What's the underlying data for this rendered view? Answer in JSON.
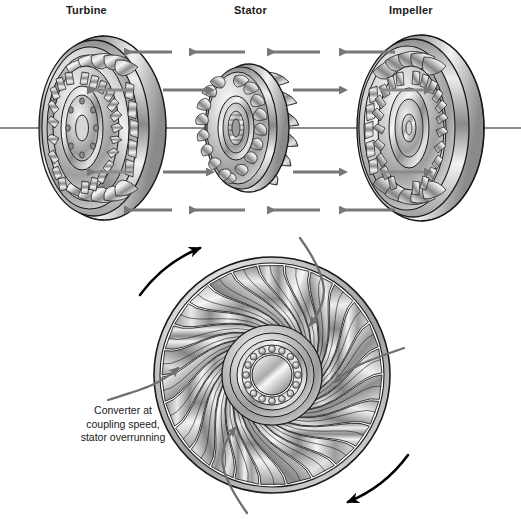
{
  "figure": {
    "title_labels": {
      "turbine": "Turbine",
      "stator": "Stator",
      "impeller": "Impeller"
    },
    "caption": {
      "line1": "Converter at",
      "line2": "coupling speed,",
      "line3": "stator overrunning"
    },
    "icons": {
      "turbine_wheel": "turbine-wheel-icon",
      "stator_wheel": "stator-wheel-icon",
      "impeller_wheel": "impeller-wheel-icon",
      "front_view_wheel": "torque-converter-front-view-icon",
      "center_bearing": "ball-bearing-icon",
      "centerline": "axis-centerline-icon",
      "flow_arrow_left": "flow-arrow-left-icon",
      "flow_arrow_right": "flow-arrow-right-icon",
      "rotation_arrow_cw_top": "rotation-arrow-clockwise-top-icon",
      "rotation_arrow_cw_bottom": "rotation-arrow-clockwise-bottom-icon",
      "swirl_arrow": "swirl-flow-arrow-icon"
    },
    "colors": {
      "background": "#ffffff",
      "outline": "#1a1a1a",
      "flow_arrow": "#777777",
      "rotation_arrow": "#000000",
      "metal_light": "#f2f2f2",
      "metal_mid": "#b8b8b8",
      "metal_dark": "#6e6e6e",
      "text": "#1a1a1a"
    },
    "geometry": {
      "centerline_y": 128,
      "turbine_center": [
        96,
        128
      ],
      "stator_center": [
        243,
        128
      ],
      "impeller_center": [
        415,
        128
      ],
      "front_view_center": [
        272,
        375
      ],
      "front_view_outer_radius": 118,
      "vane_count": 26,
      "bearing_ball_count": 16
    },
    "flow_arrows": {
      "top_row_direction": "left",
      "middle_row_direction": "right",
      "bottom_row_direction": "left",
      "top_row_count": 4,
      "middle_row_count": 2,
      "bottom_row_count": 4
    }
  }
}
